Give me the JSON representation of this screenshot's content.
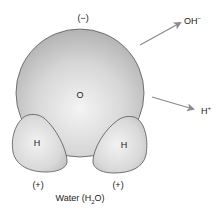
{
  "diagram": {
    "title": "Water (H2O)",
    "caption": {
      "prefix": "Water (H",
      "subscript": "2",
      "suffix": "O)"
    },
    "oxygen": {
      "label": "O",
      "charge": "(−)"
    },
    "hydrogens": [
      {
        "label": "H",
        "charge": "(+)"
      },
      {
        "label": "H",
        "charge": "(+)"
      }
    ],
    "products": [
      {
        "base": "OH",
        "charge": "−"
      },
      {
        "base": "H",
        "charge": "+"
      }
    ],
    "colors": {
      "sphere_light": "#f2f2f2",
      "sphere_dark": "#b9b9b9",
      "outline": "#555555",
      "arrow": "#8a8a8a",
      "text": "#222222"
    }
  }
}
